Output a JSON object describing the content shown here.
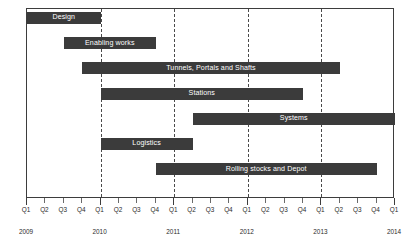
{
  "chart_data": {
    "type": "bar",
    "chart_subtype": "gantt",
    "title": "",
    "xlabel": "",
    "ylabel": "",
    "grid": true,
    "legend": false,
    "axis": {
      "quarter_ticks": [
        "Q1",
        "Q2",
        "Q3",
        "Q4",
        "Q1",
        "Q2",
        "Q3",
        "Q4",
        "Q1",
        "Q2",
        "Q3",
        "Q4",
        "Q1",
        "Q2",
        "Q3",
        "Q4",
        "Q1",
        "Q2",
        "Q3",
        "Q4",
        "Q1"
      ],
      "years": [
        "2009",
        "2010",
        "2011",
        "2012",
        "2013",
        "2014"
      ],
      "year_tick_index": [
        0,
        4,
        8,
        12,
        16,
        20
      ],
      "xlim_quarter_index": [
        0,
        20
      ],
      "gridline_quarter_index": [
        4,
        8,
        12,
        16
      ]
    },
    "bar_color": "#3b3b3b",
    "bar_label_color": "#ffffff",
    "tasks": [
      {
        "name": "Design",
        "start_q": 0,
        "end_q": 4,
        "start": "2009 Q1",
        "end": "2010 Q1"
      },
      {
        "name": "Enabling works",
        "start_q": 2,
        "end_q": 7,
        "start": "2009 Q3",
        "end": "2010 Q4"
      },
      {
        "name": "Tunnels, Portals and Shafts",
        "start_q": 3,
        "end_q": 17,
        "start": "2009 Q4",
        "end": "2013 Q2"
      },
      {
        "name": "Stations",
        "start_q": 4,
        "end_q": 15,
        "start": "2010 Q1",
        "end": "2012 Q4"
      },
      {
        "name": "Systems",
        "start_q": 9,
        "end_q": 21,
        "start": "2011 Q2",
        "end": "2014 Q2"
      },
      {
        "name": "Logistics",
        "start_q": 4,
        "end_q": 9,
        "start": "2010 Q1",
        "end": "2011 Q2"
      },
      {
        "name": "Rolling stocks and Depot",
        "start_q": 7,
        "end_q": 19,
        "start": "2010 Q4",
        "end": "2013 Q4"
      }
    ]
  }
}
